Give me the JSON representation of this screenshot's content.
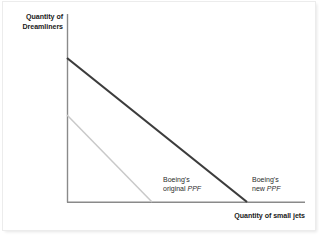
{
  "figure": {
    "background_color": "#ffffff",
    "axis_color": "#8a8a8a",
    "axes": {
      "y_title_line1": "Quantity of",
      "y_title_line2": "Dreamliners",
      "x_title": "Quantity of small jets",
      "origin_x": 67,
      "origin_y": 202,
      "y_axis_top": 14,
      "x_axis_right": 305
    },
    "annotations": [
      {
        "name": "original-ppf",
        "line1": "Boeing's",
        "line2_prefix": "original ",
        "line2_italic": "PPF",
        "x": 163,
        "y": 175
      },
      {
        "name": "new-ppf",
        "line1": "Boeing's",
        "line2_prefix": "new ",
        "line2_italic": "PPF",
        "x": 252,
        "y": 175
      }
    ]
  },
  "chart_data": {
    "type": "line",
    "title": "",
    "xlabel": "Quantity of small jets",
    "ylabel": "Quantity of Dreamliners",
    "grid": false,
    "legend": "inline-annotations",
    "axis_ticks": [],
    "xlim": [
      0,
      100
    ],
    "ylim": [
      0,
      100
    ],
    "series": [
      {
        "name": "Boeing's original PPF",
        "color": "#c9c9c9",
        "width": 1.5,
        "points_px": [
          [
            67,
            115
          ],
          [
            152,
            202
          ]
        ],
        "x": [
          0,
          35.7
        ],
        "y": [
          46.3,
          0
        ]
      },
      {
        "name": "Boeing's new PPF",
        "color": "#3c3c3c",
        "width": 2.2,
        "points_px": [
          [
            67,
            58
          ],
          [
            247,
            202
          ]
        ],
        "x": [
          0,
          75.6
        ],
        "y": [
          76.6,
          0
        ]
      }
    ]
  }
}
